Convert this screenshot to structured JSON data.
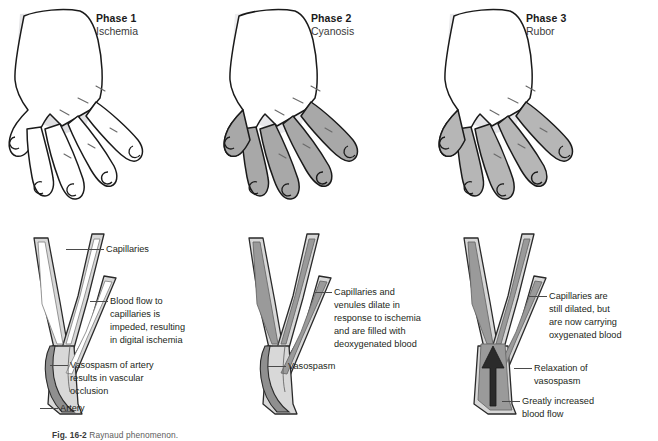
{
  "figure": {
    "caption_label": "Fig. 16-2",
    "caption_text": "Raynaud phenomenon."
  },
  "palette": {
    "outline": "#1a1a1a",
    "hand_dorsum_shade": "#e2e2e4",
    "finger_ischemia": "#ffffff",
    "finger_cyanosis": "#a8a8a8",
    "finger_rubor": "#b6b6b6",
    "vessel_wall": "#d8d8d8",
    "vessel_lumen_empty": "#ffffff",
    "vessel_lumen_filled": "#9a9a9a",
    "artery_fill": "#8f8f8f",
    "arrow_fill": "#2b2b2b",
    "leader_line": "#4a4a4a",
    "text": "#231f20"
  },
  "phases": [
    {
      "id": "phase-1",
      "title": "Phase 1",
      "subtitle": "Ischemia",
      "hand": {
        "dorsum_state": "shaded",
        "finger_state": "pale",
        "finger_fill": "#ffffff"
      },
      "vessel": {
        "lumen_state": "empty",
        "lumen_fill": "#ffffff",
        "has_arrow": false,
        "artery_filled": true
      },
      "labels": [
        {
          "id": "capillaries",
          "text": "Capillaries"
        },
        {
          "id": "blood-flow-impeded",
          "text": "Blood flow to\ncapillaries is\nimpeded, resulting\nin digital ischemia"
        },
        {
          "id": "vasospasm-occlusion",
          "text": "Vasospasm of artery\nresults in vascular\nocclusion"
        },
        {
          "id": "artery",
          "text": "Artery"
        }
      ]
    },
    {
      "id": "phase-2",
      "title": "Phase 2",
      "subtitle": "Cyanosis",
      "hand": {
        "dorsum_state": "shaded",
        "finger_state": "cyanotic",
        "finger_fill": "#a8a8a8"
      },
      "vessel": {
        "lumen_state": "filled-deoxygenated",
        "lumen_fill": "#9a9a9a",
        "has_arrow": false,
        "artery_filled": true
      },
      "labels": [
        {
          "id": "capillaries-dilate",
          "text": "Capillaries and\nvenules dilate in\nresponse to ischemia\nand are filled with\ndeoxygenated blood"
        },
        {
          "id": "vasospasm",
          "text": "Vasospasm"
        }
      ]
    },
    {
      "id": "phase-3",
      "title": "Phase 3",
      "subtitle": "Rubor",
      "hand": {
        "dorsum_state": "shaded",
        "finger_state": "rubor",
        "finger_fill": "#b6b6b6"
      },
      "vessel": {
        "lumen_state": "filled-oxygenated",
        "lumen_fill": "#9a9a9a",
        "has_arrow": true,
        "artery_filled": true
      },
      "labels": [
        {
          "id": "capillaries-oxygenated",
          "text": "Capillaries are\nstill dilated, but\nare now carrying\noxygenated blood"
        },
        {
          "id": "relaxation-vasospasm",
          "text": "Relaxation of\nvasospasm"
        },
        {
          "id": "increased-blood-flow",
          "text": "Greatly increased\nblood flow"
        }
      ]
    }
  ]
}
